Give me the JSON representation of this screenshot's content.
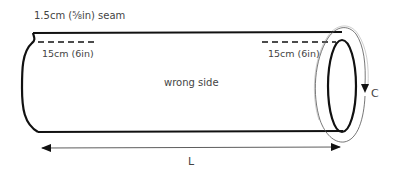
{
  "diagram": {
    "seam_label": "1.5cm (⅝in) seam",
    "left_opening_label": "15cm (6in)",
    "right_opening_label": "15cm (6in)",
    "center_label": "wrong side",
    "circumference_label": "C",
    "length_label": "L",
    "colors": {
      "stroke": "#111111",
      "thin_stroke": "#555555",
      "text": "#444444",
      "background": "#ffffff"
    }
  }
}
